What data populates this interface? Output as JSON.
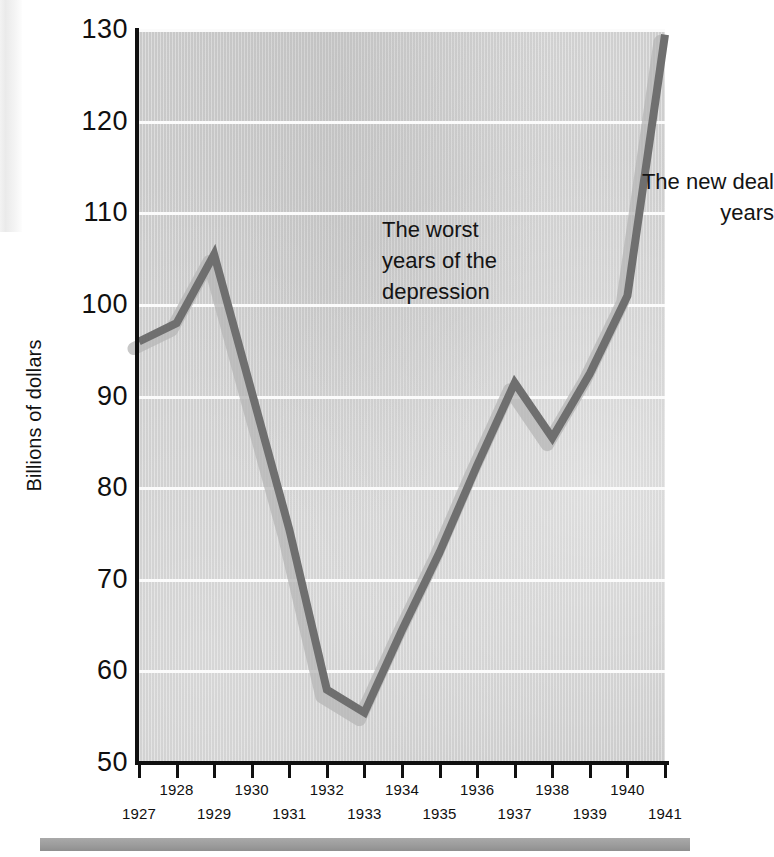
{
  "figure": {
    "y_axis_title": "Billions of dollars"
  },
  "chart_data": {
    "type": "line",
    "title": "",
    "xlabel": "",
    "ylabel": "Billions of dollars",
    "xlim": [
      1927,
      1941
    ],
    "ylim": [
      50,
      130
    ],
    "grid": true,
    "legend": "none",
    "x": [
      1927,
      1928,
      1929,
      1930,
      1931,
      1932,
      1933,
      1934,
      1935,
      1936,
      1937,
      1938,
      1939,
      1940,
      1941
    ],
    "categories": [
      "1927",
      "1928",
      "1929",
      "1930",
      "1931",
      "1932",
      "1933",
      "1934",
      "1935",
      "1936",
      "1937",
      "1938",
      "1939",
      "1940",
      "1941"
    ],
    "series": [
      {
        "name": "Gross national product",
        "color": "#6f6f6f",
        "values": [
          96,
          98,
          105.5,
          90.5,
          75.5,
          58,
          55.5,
          64.5,
          73,
          82.5,
          91.5,
          85.5,
          92.5,
          101,
          129.5
        ]
      }
    ],
    "y_ticks": [
      50,
      60,
      70,
      80,
      90,
      100,
      110,
      120,
      130
    ],
    "y_tick_labels": [
      "50",
      "60",
      "70",
      "80",
      "90",
      "100",
      "110",
      "120",
      "130"
    ],
    "x_ticks": [
      1927,
      1928,
      1929,
      1930,
      1931,
      1932,
      1933,
      1934,
      1935,
      1936,
      1937,
      1938,
      1939,
      1940,
      1941
    ],
    "x_tick_labels_upper": [
      "",
      "1928",
      "",
      "1930",
      "",
      "1932",
      "",
      "1934",
      "",
      "1936",
      "",
      "1938",
      "",
      "1940",
      ""
    ],
    "x_tick_labels_lower": [
      "1927",
      "",
      "1929",
      "",
      "1931",
      "",
      "1933",
      "",
      "1935",
      "",
      "1937",
      "",
      "1939",
      "",
      "1941"
    ],
    "annotations": [
      {
        "id": "depression",
        "text": "The worst\nyears of the\ndepression",
        "align": "left"
      },
      {
        "id": "new-deal",
        "text": "The new deal\nyears",
        "align": "right"
      }
    ]
  },
  "colors": {
    "plot_background": "#cfcfcf",
    "gridline": "#fbfbfb",
    "axis": "#101010",
    "series_line": "#6f6f6f",
    "series_shadow": "#b5b5b5",
    "bottom_rule": "#9c9c9c"
  }
}
